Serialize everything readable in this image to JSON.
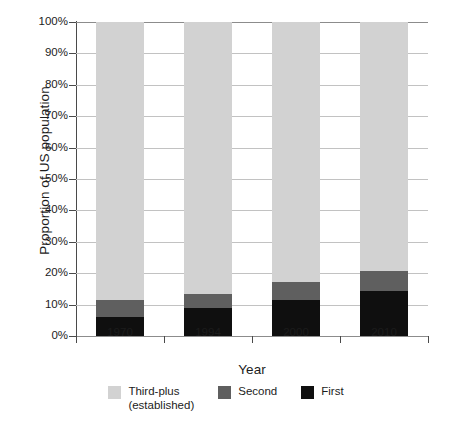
{
  "chart_data": {
    "type": "bar",
    "subtype": "stacked-percent",
    "title": "",
    "xlabel": "Year",
    "ylabel": "Proportion of US population",
    "categories": [
      "1970",
      "1994",
      "2000",
      "2010"
    ],
    "ylim": [
      0,
      100
    ],
    "ytick_labels": [
      "0%",
      "10%",
      "20%",
      "30%",
      "40%",
      "50%",
      "60%",
      "70%",
      "80%",
      "90%",
      "100%"
    ],
    "ytick_values": [
      0,
      10,
      20,
      30,
      40,
      50,
      60,
      70,
      80,
      90,
      100
    ],
    "grid": true,
    "legend_position": "bottom",
    "series": [
      {
        "name": "Third-plus\n(established)",
        "short_name": "Third-plus (established)",
        "color": "#d2d2d2",
        "values": [
          88.5,
          86.5,
          82.8,
          79.3
        ]
      },
      {
        "name": "Second",
        "short_name": "Second",
        "color": "#5f5f5f",
        "values": [
          5.5,
          4.5,
          5.6,
          6.3
        ]
      },
      {
        "name": "First",
        "short_name": "First",
        "color": "#0f0f0f",
        "values": [
          6.0,
          9.0,
          11.6,
          14.4
        ]
      }
    ],
    "cumulative_tops": {
      "first": [
        6.0,
        9.0,
        11.6,
        14.4
      ],
      "second": [
        11.5,
        13.5,
        17.2,
        20.7
      ],
      "third_plus": [
        100,
        100,
        100,
        100
      ]
    }
  },
  "legend": [
    {
      "label": "Third-plus\n(established)",
      "color": "#d2d2d2"
    },
    {
      "label": "Second",
      "color": "#5f5f5f"
    },
    {
      "label": "First",
      "color": "#0f0f0f"
    }
  ]
}
